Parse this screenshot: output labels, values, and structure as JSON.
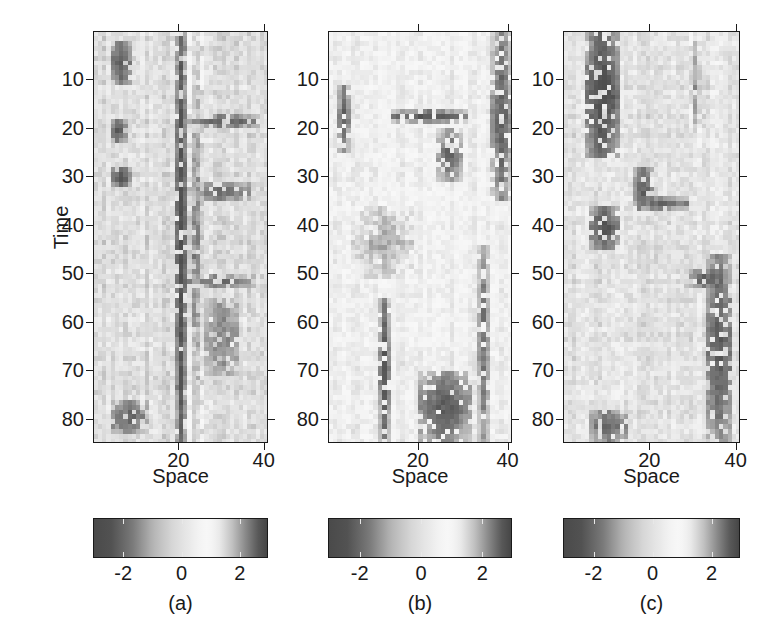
{
  "figure": {
    "background_color": "#ffffff",
    "n_panels": 3,
    "axis_titles": {
      "y": "Time",
      "x": "Space"
    }
  },
  "panels": [
    {
      "caption": "(a)",
      "y_axis_title": "Time",
      "x_axis_title": "Space",
      "y_ticks": [
        "10",
        "20",
        "30",
        "40",
        "50",
        "60",
        "70",
        "80"
      ],
      "x_ticks": [
        "20",
        "40"
      ],
      "colorbar_ticks": [
        "-2",
        "0",
        "2"
      ]
    },
    {
      "caption": "(b)",
      "y_axis_title": "Time",
      "x_axis_title": "Space",
      "y_ticks": [
        "10",
        "20",
        "30",
        "40",
        "50",
        "60",
        "70",
        "80"
      ],
      "x_ticks": [
        "20",
        "40"
      ],
      "colorbar_ticks": [
        "-2",
        "0",
        "2"
      ]
    },
    {
      "caption": "(c)",
      "y_axis_title": "Time",
      "x_axis_title": "Space",
      "y_ticks": [
        "10",
        "20",
        "30",
        "40",
        "50",
        "60",
        "70",
        "80"
      ],
      "x_ticks": [
        "20",
        "40"
      ],
      "colorbar_ticks": [
        "-2",
        "0",
        "2"
      ]
    }
  ],
  "chart_data": [
    {
      "type": "heatmap",
      "title": "(a)",
      "xlabel": "Space",
      "ylabel": "Time",
      "xlim": [
        0,
        41
      ],
      "ylim": [
        85,
        0
      ],
      "xticks": [
        20,
        40
      ],
      "yticks": [
        10,
        20,
        30,
        40,
        50,
        60,
        70,
        80
      ],
      "nx": 41,
      "ny": 85,
      "zlim": [
        -3,
        3
      ],
      "colorbar": {
        "ticks": [
          -2,
          0,
          2
        ],
        "range": [
          -3,
          3
        ],
        "colormap": "gray-diverging-dark-light-dark"
      },
      "grid": false,
      "legend": null,
      "structure_note": "Mostly mid-gray background (value near 0) with a strong dark (negative) vertical band centred at Space 19-21 spanning all Time, a bright (positive) band at Space 22-25, and scattered dark/bright streaks near Space 4-8 and 26-35.",
      "features": [
        {
          "kind": "dark-vertical-band",
          "space_range": [
            19,
            21
          ],
          "time_range": [
            0,
            85
          ],
          "value": -2.6
        },
        {
          "kind": "bright-vertical-band",
          "space_range": [
            22,
            25
          ],
          "time_range": [
            0,
            85
          ],
          "value": 2.2
        },
        {
          "kind": "dark-patch",
          "space_range": [
            4,
            8
          ],
          "time_range": [
            2,
            10
          ],
          "value": -2.2
        },
        {
          "kind": "dark-patch",
          "space_range": [
            4,
            7
          ],
          "time_range": [
            18,
            22
          ],
          "value": -2.3
        },
        {
          "kind": "dark-patch",
          "space_range": [
            4,
            8
          ],
          "time_range": [
            28,
            31
          ],
          "value": -2.4
        },
        {
          "kind": "dark-horizontal-streak",
          "space_range": [
            22,
            38
          ],
          "time_range": [
            17,
            19
          ],
          "value": -2.1
        },
        {
          "kind": "dark-horizontal-streak",
          "space_range": [
            22,
            36
          ],
          "time_range": [
            31,
            34
          ],
          "value": -2.0
        },
        {
          "kind": "dark-horizontal-streak",
          "space_range": [
            22,
            37
          ],
          "time_range": [
            50,
            52
          ],
          "value": -1.9
        },
        {
          "kind": "dark-patch",
          "space_range": [
            26,
            33
          ],
          "time_range": [
            55,
            70
          ],
          "value": -1.6
        },
        {
          "kind": "dark-patch",
          "space_range": [
            4,
            12
          ],
          "time_range": [
            76,
            82
          ],
          "value": -2.0
        }
      ]
    },
    {
      "type": "heatmap",
      "title": "(b)",
      "xlabel": "Space",
      "ylabel": "Time",
      "xlim": [
        0,
        41
      ],
      "ylim": [
        85,
        0
      ],
      "xticks": [
        20,
        40
      ],
      "yticks": [
        10,
        20,
        30,
        40,
        50,
        60,
        70,
        80
      ],
      "nx": 41,
      "ny": 85,
      "zlim": [
        -3,
        3
      ],
      "colorbar": {
        "ticks": [
          -2,
          0,
          2
        ],
        "range": [
          -3,
          3
        ],
        "colormap": "gray-diverging-dark-light-dark"
      },
      "grid": false,
      "legend": null,
      "structure_note": "Lighter overall (slightly positive) background with diffuse speckle; dark vertical streaks near Space 2-4, 11-13 and 36-40, a dark cluster around Space 24-29 at Time 13-30, and a dark blotch near Space 20-30 at Time 70-84.",
      "features": [
        {
          "kind": "dark-vertical-streak",
          "space_range": [
            2,
            4
          ],
          "time_range": [
            11,
            24
          ],
          "value": -2.2
        },
        {
          "kind": "dark-vertical-streak",
          "space_range": [
            11,
            13
          ],
          "time_range": [
            55,
            84
          ],
          "value": -2.3
        },
        {
          "kind": "dark-vertical-streak",
          "space_range": [
            36,
            40
          ],
          "time_range": [
            0,
            34
          ],
          "value": -2.1
        },
        {
          "kind": "dark-horizontal-streak",
          "space_range": [
            14,
            30
          ],
          "time_range": [
            16,
            18
          ],
          "value": -2.3
        },
        {
          "kind": "dark-patch",
          "space_range": [
            24,
            29
          ],
          "time_range": [
            20,
            30
          ],
          "value": -2.0
        },
        {
          "kind": "dark-patch",
          "space_range": [
            20,
            31
          ],
          "time_range": [
            70,
            84
          ],
          "value": -2.2
        },
        {
          "kind": "dark-vertical-streak",
          "space_range": [
            33,
            35
          ],
          "time_range": [
            44,
            84
          ],
          "value": -1.8
        },
        {
          "kind": "bright-patch",
          "space_range": [
            5,
            18
          ],
          "time_range": [
            36,
            50
          ],
          "value": 1.8
        }
      ]
    },
    {
      "type": "heatmap",
      "title": "(c)",
      "xlabel": "Space",
      "ylabel": "Time",
      "xlim": [
        0,
        41
      ],
      "ylim": [
        85,
        0
      ],
      "xticks": [
        20,
        40
      ],
      "yticks": [
        10,
        20,
        30,
        40,
        50,
        60,
        70,
        80
      ],
      "nx": 41,
      "ny": 85,
      "zlim": [
        -3,
        3
      ],
      "colorbar": {
        "ticks": [
          -2,
          0,
          2
        ],
        "range": [
          -3,
          3
        ],
        "colormap": "gray-diverging-dark-light-dark"
      },
      "grid": false,
      "legend": null,
      "structure_note": "Mid-gray background with a large dark block near Space 5-12 at Time 0-25, a second dark block at Space 6-12 around Time 36-44, dark streaks around Space 16-20 at Time 28-36, and dark vertical structure near Space 33-38 across lower Time.",
      "features": [
        {
          "kind": "dark-block",
          "space_range": [
            5,
            12
          ],
          "time_range": [
            0,
            25
          ],
          "value": -2.6
        },
        {
          "kind": "dark-block",
          "space_range": [
            6,
            12
          ],
          "time_range": [
            36,
            44
          ],
          "value": -2.4
        },
        {
          "kind": "dark-patch",
          "space_range": [
            16,
            20
          ],
          "time_range": [
            28,
            36
          ],
          "value": -2.1
        },
        {
          "kind": "dark-horizontal-streak",
          "space_range": [
            17,
            28
          ],
          "time_range": [
            34,
            36
          ],
          "value": -2.0
        },
        {
          "kind": "dark-vertical-streak",
          "space_range": [
            33,
            38
          ],
          "time_range": [
            46,
            84
          ],
          "value": -2.2
        },
        {
          "kind": "dark-horizontal-streak",
          "space_range": [
            28,
            36
          ],
          "time_range": [
            49,
            52
          ],
          "value": -2.1
        },
        {
          "kind": "dark-patch",
          "space_range": [
            6,
            14
          ],
          "time_range": [
            78,
            84
          ],
          "value": -2.0
        },
        {
          "kind": "bright-vertical-streak",
          "space_range": [
            29,
            31
          ],
          "time_range": [
            0,
            20
          ],
          "value": 2.0
        }
      ]
    }
  ]
}
